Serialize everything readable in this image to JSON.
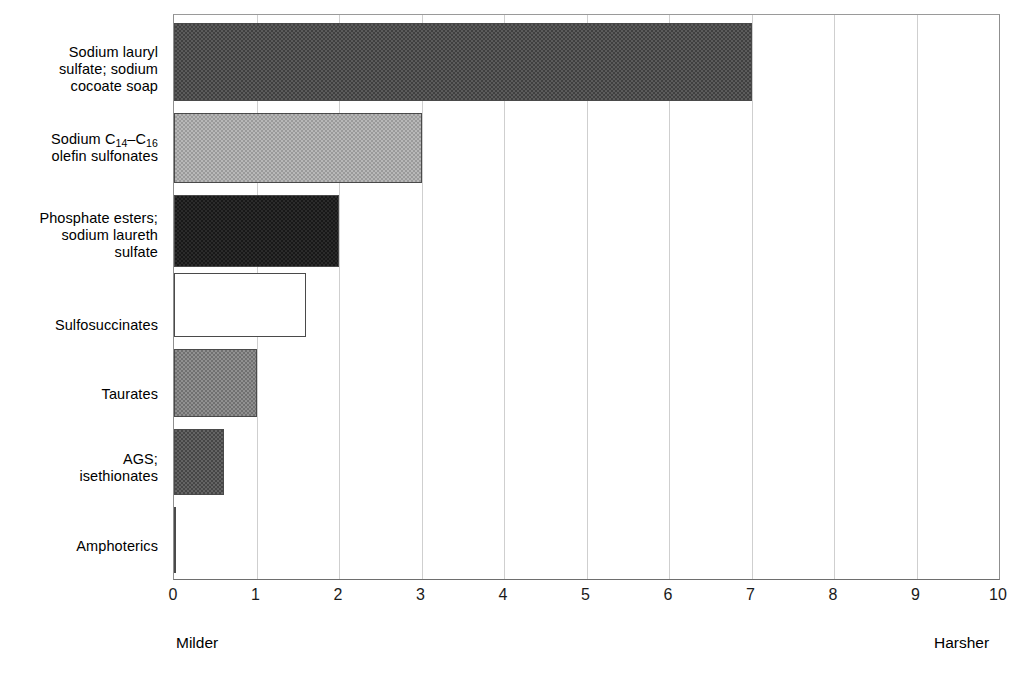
{
  "chart_data": {
    "type": "bar",
    "orientation": "horizontal",
    "title": "",
    "subtitle": "",
    "xlabel": "",
    "ylabel": "",
    "xlim": [
      0,
      10
    ],
    "ylim": null,
    "grid": true,
    "legend": null,
    "legend_position": "none",
    "categories": [
      "Sodium lauryl sulfate; sodium cocoate soap",
      "Sodium C14–C16 olefin sulfonates",
      "Phosphate esters; sodium laureth sulfate",
      "Sulfosuccinates",
      "Taurates",
      "AGS; isethionates",
      "Amphoterics"
    ],
    "values": [
      10,
      7,
      3,
      2,
      1.6,
      1.0,
      0.6
    ],
    "x_ticks": [
      "0",
      "1",
      "2",
      "3",
      "4",
      "5",
      "6",
      "7",
      "8",
      "9",
      "10"
    ],
    "annotations": {
      "axis_left_note": "Milder",
      "axis_right_note": "Harsher"
    },
    "bar_fills": [
      "#5c5c5c",
      "#b8b8b8",
      "#2b2b2b",
      "#ffffff",
      "#909090",
      "#646464",
      "#cfcfcf"
    ],
    "bar_border_color": "#4a4a4a",
    "gridline_color": "#cfcfcf",
    "axis_color": "#6e6e6e"
  },
  "labels": {
    "cat0_line1": "Sodium lauryl",
    "cat0_line2": "sulfate; sodium",
    "cat0_line3": "cocoate soap",
    "cat1_pre": "Sodium C",
    "cat1_sub1": "14",
    "cat1_dash": "–C",
    "cat1_sub2": "16",
    "cat1_line2": "olefin sulfonates",
    "cat2_line1": "Phosphate esters;",
    "cat2_line2": "sodium laureth",
    "cat2_line3": "sulfate",
    "cat3_line1": "Sulfosuccinates",
    "cat4_line1": "Taurates",
    "cat5_line1": "AGS;",
    "cat5_line2": "isethionates",
    "cat6_line1": "Amphoterics"
  },
  "axis": {
    "ticks": [
      "0",
      "1",
      "2",
      "3",
      "4",
      "5",
      "6",
      "7",
      "8",
      "9",
      "10"
    ],
    "milder": "Milder",
    "harsher": "Harsher"
  }
}
